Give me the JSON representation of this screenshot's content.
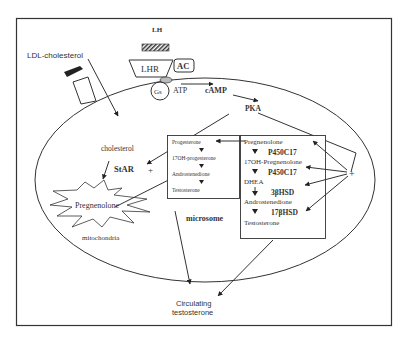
{
  "labels": {
    "lh": "LH",
    "ldl": "LDL-cholesterol",
    "lhr": "LHR",
    "ac": "AC",
    "gs": "Gs",
    "atp": "ATP",
    "camp": "cAMP",
    "pka": "PKA",
    "cholesterol": "cholesterol",
    "star": "StAR",
    "plus_left": "+",
    "plus_right": "+",
    "pregnenolone_mito": "Pregnenolone",
    "mitochondria": "mitochondria",
    "microsome": "microsome",
    "circulating_line1": "Circulating",
    "circulating_line2": "testosterone"
  },
  "delta4_box": {
    "items": [
      "Progesterone",
      "17OH-progesterone",
      "Androstenedione",
      "Testosterone"
    ]
  },
  "delta5_box": {
    "items": [
      "Pregnenolone",
      "17OH-Pregnenolone",
      "DHEA",
      "Androstenedione",
      "Testosterone"
    ],
    "enzymes": [
      "P450C17",
      "P450C17",
      "3βHSD",
      "17βHSD"
    ]
  }
}
